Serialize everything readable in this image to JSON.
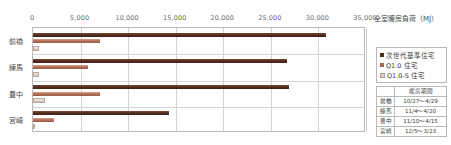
{
  "chart_data": {
    "type": "bar",
    "orientation": "horizontal",
    "title": "",
    "xlabel": "全室暖房負荷（MJ）",
    "ylabel": "",
    "xlim": [
      0,
      35000
    ],
    "xticks": [
      "0",
      "5,000",
      "10,000",
      "15,000",
      "20,000",
      "25,000",
      "30,000",
      "35,000"
    ],
    "xtick_values": [
      0,
      5000,
      10000,
      15000,
      20000,
      25000,
      30000,
      35000
    ],
    "grid": true,
    "legend_position": "right",
    "categories": [
      "前橋",
      "練馬",
      "豊中",
      "宮崎"
    ],
    "series": [
      {
        "name": "次世代基準住宅",
        "color": "#4a2a1c",
        "values": [
          30800,
          26700,
          26900,
          14300
        ]
      },
      {
        "name": "Q1.0 住宅",
        "color": "#a9674f",
        "values": [
          7000,
          5800,
          7000,
          2200
        ]
      },
      {
        "name": "Q1.0-S 住宅",
        "color": "#ded0c6",
        "values": [
          600,
          600,
          1300,
          150
        ]
      }
    ]
  },
  "axis_title": "全室暖房負荷（MJ）",
  "legend": {
    "items": [
      {
        "label": "次世代基準住宅",
        "marker": "square-marker-dark"
      },
      {
        "label": "Q1.0 住宅",
        "marker": "square-marker-mid"
      },
      {
        "label": "Q1.0-S 住宅",
        "marker": "square-marker-light"
      }
    ]
  },
  "table": {
    "corner_label": "",
    "header": "暖房期間",
    "rows": [
      {
        "city": "前橋",
        "period": "10/27〜4/29"
      },
      {
        "city": "練馬",
        "period": "11/4〜4/20"
      },
      {
        "city": "豊中",
        "period": "11/10〜4/15"
      },
      {
        "city": "宮崎",
        "period": "12/5〜3/23"
      }
    ]
  }
}
